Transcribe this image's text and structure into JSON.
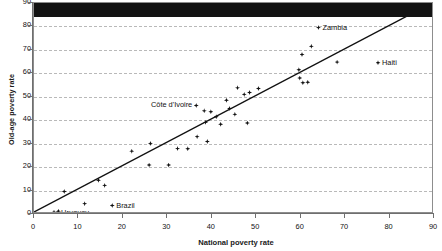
{
  "chart_data": {
    "type": "scatter",
    "title": "",
    "xlabel": "National poverty rate",
    "ylabel": "Old-age poverty rate",
    "xlim": [
      0,
      90
    ],
    "ylim": [
      0,
      90
    ],
    "xticks": [
      0,
      10,
      20,
      30,
      40,
      50,
      60,
      70,
      80,
      90
    ],
    "yticks": [
      0,
      10,
      20,
      30,
      40,
      50,
      60,
      70,
      80,
      90
    ],
    "grid": "horizontal-dashed",
    "legend": "none",
    "reference_line": {
      "description": "45-degree equality line",
      "from": [
        0,
        0
      ],
      "to": [
        90,
        90
      ]
    },
    "marker": "diamond",
    "marker_color": "#111111",
    "points": [
      {
        "x": 4.5,
        "y": 0.8,
        "label": "",
        "label_side": ""
      },
      {
        "x": 5.2,
        "y": 0.5,
        "label": "Uruguay",
        "label_side": "right"
      },
      {
        "x": 5.5,
        "y": 1.2,
        "label": "",
        "label_side": ""
      },
      {
        "x": 6.8,
        "y": 9.6,
        "label": "",
        "label_side": ""
      },
      {
        "x": 11.4,
        "y": 4.4,
        "label": "",
        "label_side": ""
      },
      {
        "x": 14.5,
        "y": 14.4,
        "label": "",
        "label_side": ""
      },
      {
        "x": 15.9,
        "y": 12.2,
        "label": "",
        "label_side": ""
      },
      {
        "x": 17.6,
        "y": 3.6,
        "label": "Brazil",
        "label_side": "right"
      },
      {
        "x": 22.0,
        "y": 26.8,
        "label": "",
        "label_side": ""
      },
      {
        "x": 25.9,
        "y": 20.9,
        "label": "",
        "label_side": ""
      },
      {
        "x": 26.2,
        "y": 30.1,
        "label": "",
        "label_side": ""
      },
      {
        "x": 30.3,
        "y": 20.9,
        "label": "",
        "label_side": ""
      },
      {
        "x": 32.3,
        "y": 27.9,
        "label": "",
        "label_side": ""
      },
      {
        "x": 34.6,
        "y": 27.8,
        "label": "",
        "label_side": ""
      },
      {
        "x": 36.5,
        "y": 46.3,
        "label": "Côte d'Ivoire",
        "label_side": "left"
      },
      {
        "x": 36.7,
        "y": 33.0,
        "label": "",
        "label_side": ""
      },
      {
        "x": 38.3,
        "y": 44.0,
        "label": "",
        "label_side": ""
      },
      {
        "x": 38.6,
        "y": 39.1,
        "label": "",
        "label_side": ""
      },
      {
        "x": 39.0,
        "y": 30.9,
        "label": "",
        "label_side": ""
      },
      {
        "x": 39.8,
        "y": 43.6,
        "label": "",
        "label_side": ""
      },
      {
        "x": 41.0,
        "y": 41.5,
        "label": "",
        "label_side": ""
      },
      {
        "x": 42.0,
        "y": 38.3,
        "label": "",
        "label_side": ""
      },
      {
        "x": 43.3,
        "y": 48.5,
        "label": "",
        "label_side": ""
      },
      {
        "x": 44.0,
        "y": 45.0,
        "label": "",
        "label_side": ""
      },
      {
        "x": 45.2,
        "y": 42.5,
        "label": "",
        "label_side": ""
      },
      {
        "x": 45.8,
        "y": 53.8,
        "label": "",
        "label_side": ""
      },
      {
        "x": 47.3,
        "y": 51.0,
        "label": "",
        "label_side": ""
      },
      {
        "x": 48.0,
        "y": 38.8,
        "label": "",
        "label_side": ""
      },
      {
        "x": 48.5,
        "y": 51.8,
        "label": "",
        "label_side": ""
      },
      {
        "x": 50.5,
        "y": 53.5,
        "label": "",
        "label_side": ""
      },
      {
        "x": 59.6,
        "y": 61.5,
        "label": "",
        "label_side": ""
      },
      {
        "x": 59.8,
        "y": 58.0,
        "label": "",
        "label_side": ""
      },
      {
        "x": 60.3,
        "y": 68.0,
        "label": "",
        "label_side": ""
      },
      {
        "x": 60.5,
        "y": 56.0,
        "label": "",
        "label_side": ""
      },
      {
        "x": 61.6,
        "y": 56.2,
        "label": "",
        "label_side": ""
      },
      {
        "x": 62.4,
        "y": 71.5,
        "label": "",
        "label_side": ""
      },
      {
        "x": 64.0,
        "y": 79.5,
        "label": "Zambia",
        "label_side": "right"
      },
      {
        "x": 68.2,
        "y": 64.8,
        "label": "",
        "label_side": ""
      },
      {
        "x": 77.4,
        "y": 64.5,
        "label": "Haiti",
        "label_side": "right"
      }
    ]
  },
  "figure": {
    "xlabel": "National poverty rate",
    "ylabel": "Old-age poverty rate"
  }
}
